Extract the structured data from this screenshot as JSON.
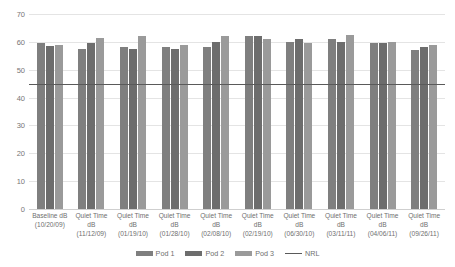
{
  "chart_data": {
    "type": "bar",
    "title": "",
    "xlabel": "",
    "ylabel": "",
    "ylim": [
      0,
      70
    ],
    "ytick_step": 10,
    "yticks": [
      "70",
      "60",
      "50",
      "40",
      "30",
      "20",
      "10",
      "0"
    ],
    "grid": true,
    "legend_position": "bottom",
    "categories": [
      "Baseline dB (10/20/09)",
      "Quiet Time dB (11/12/09)",
      "Quiet Time dB (01/19/10)",
      "Quiet Time dB (01/28/10)",
      "Quiet Time dB (02/08/10)",
      "Quiet Time dB (02/19/10)",
      "Quiet Time dB (06/30/10)",
      "Quiet Time dB (03/11/11)",
      "Quiet Time dB (04/06/11)",
      "Quiet Time dB (09/26/11)"
    ],
    "category_lines": [
      {
        "l1": "Baseline dB",
        "l2": "(10/20/09)"
      },
      {
        "l1": "Quiet Time dB",
        "l2": "(11/12/09)"
      },
      {
        "l1": "Quiet Time dB",
        "l2": "(01/19/10)"
      },
      {
        "l1": "Quiet Time dB",
        "l2": "(01/28/10)"
      },
      {
        "l1": "Quiet Time dB",
        "l2": "(02/08/10)"
      },
      {
        "l1": "Quiet Time dB",
        "l2": "(02/19/10)"
      },
      {
        "l1": "Quiet Time dB",
        "l2": "(06/30/10)"
      },
      {
        "l1": "Quiet Time dB",
        "l2": "(03/11/11)"
      },
      {
        "l1": "Quiet Time dB",
        "l2": "(04/06/11)"
      },
      {
        "l1": "Quiet Time dB",
        "l2": "(09/26/11)"
      }
    ],
    "series": [
      {
        "name": "Pod 1",
        "color": "#7f7f7f",
        "values": [
          59.5,
          57.5,
          58.0,
          58.0,
          58.0,
          62.0,
          60.0,
          61.0,
          59.5,
          57.0
        ]
      },
      {
        "name": "Pod 2",
        "color": "#6d6d6d",
        "values": [
          58.5,
          59.5,
          57.5,
          57.5,
          60.0,
          62.0,
          61.0,
          60.0,
          59.5,
          58.0
        ]
      },
      {
        "name": "Pod 3",
        "color": "#9a9a9a",
        "values": [
          59.0,
          61.5,
          62.0,
          59.0,
          62.0,
          61.0,
          59.5,
          62.5,
          60.0,
          59.0
        ]
      }
    ],
    "threshold": {
      "name": "NRL",
      "value": 45,
      "color": "#5a5a5a"
    }
  },
  "legend": {
    "items": [
      {
        "label": "Pod 1",
        "type": "swatch",
        "color": "#7f7f7f"
      },
      {
        "label": "Pod 2",
        "type": "swatch",
        "color": "#6d6d6d"
      },
      {
        "label": "Pod 3",
        "type": "swatch",
        "color": "#9a9a9a"
      },
      {
        "label": "NRL",
        "type": "line",
        "color": "#5a5a5a"
      }
    ]
  }
}
